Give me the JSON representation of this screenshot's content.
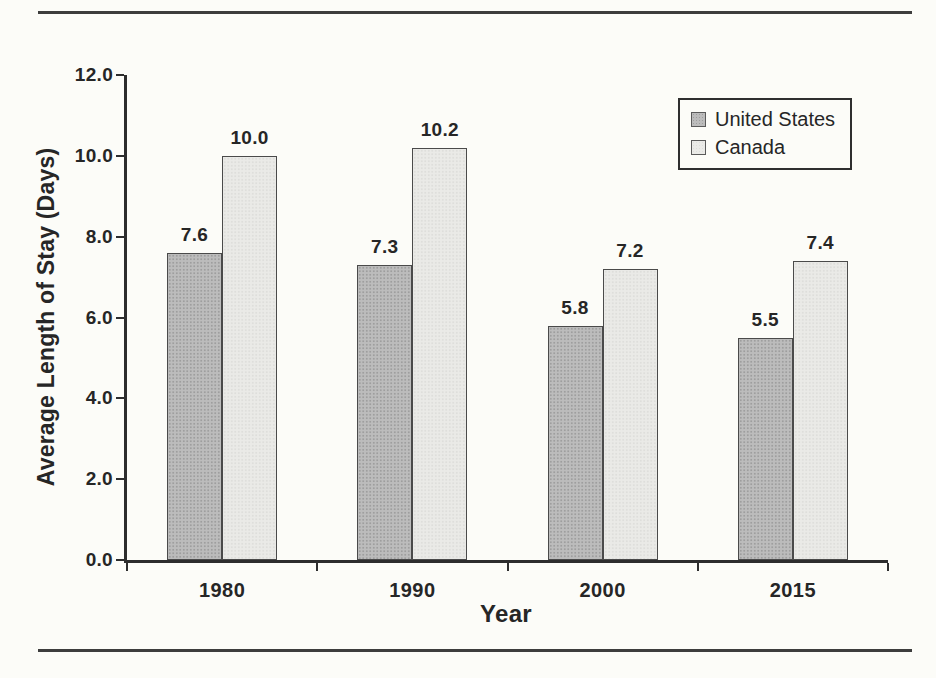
{
  "figure": {
    "background_color": "#fcfcf8",
    "rule_color": "#3d3d3d",
    "axis_color": "#2d2d2d",
    "text_color": "#262626"
  },
  "chart_data": {
    "type": "bar",
    "title": "",
    "xlabel": "Year",
    "ylabel": "Average Length of Stay (Days)",
    "categories": [
      "1980",
      "1990",
      "2000",
      "2015"
    ],
    "series": [
      {
        "name": "United States",
        "values": [
          7.6,
          7.3,
          5.8,
          5.5
        ],
        "value_labels": [
          "7.6",
          "7.3",
          "5.8",
          "5.5"
        ],
        "color": "#bcbcbc",
        "texture_dot_color": "#9e9e9e"
      },
      {
        "name": "Canada",
        "values": [
          10.0,
          10.2,
          7.2,
          7.4
        ],
        "value_labels": [
          "10.0",
          "10.2",
          "7.2",
          "7.4"
        ],
        "color": "#eaeae7",
        "texture_dot_color": "#dededb"
      }
    ],
    "ylim": [
      0,
      12
    ],
    "y_ticks": [
      {
        "value": 0,
        "label": "0.0"
      },
      {
        "value": 2,
        "label": "2.0"
      },
      {
        "value": 4,
        "label": "4.0"
      },
      {
        "value": 6,
        "label": "6.0"
      },
      {
        "value": 8,
        "label": "8.0"
      },
      {
        "value": 10,
        "label": "10.0"
      },
      {
        "value": 12,
        "label": "12.0"
      }
    ],
    "legend": {
      "position": "top-right",
      "entries": [
        "United States",
        "Canada"
      ]
    },
    "grid": false
  }
}
